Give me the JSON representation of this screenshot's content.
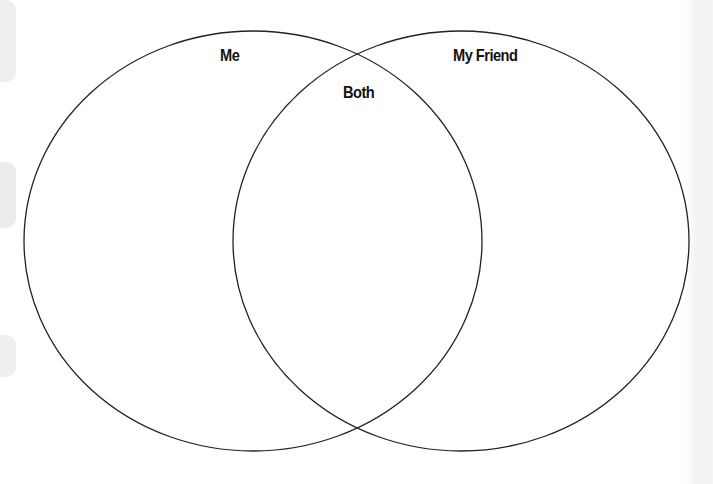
{
  "diagram": {
    "type": "venn-diagram",
    "stroke_color": "#222222",
    "background_color": "#ffffff",
    "circles": [
      {
        "id": "me",
        "label": "Me",
        "cx": 253,
        "cy": 241,
        "rx": 229,
        "ry": 210
      },
      {
        "id": "friend",
        "label": "My Friend",
        "cx": 461,
        "cy": 241,
        "rx": 228,
        "ry": 210
      }
    ],
    "overlap_label": "Both"
  }
}
